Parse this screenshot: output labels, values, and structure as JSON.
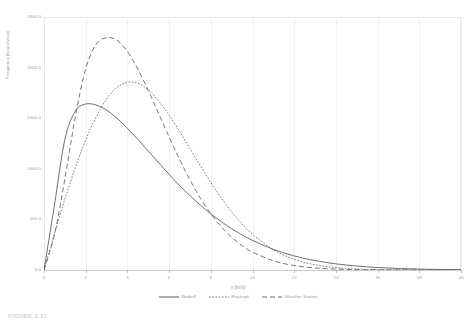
{
  "chart_data": {
    "type": "line",
    "title": "",
    "xlabel": "v [m/s]",
    "ylabel": "Frequency [hours/year]",
    "xlim": [
      0,
      20
    ],
    "ylim": [
      0,
      2500
    ],
    "grid": true,
    "legend_position": "bottom",
    "xticks": [
      "0",
      "2",
      "4",
      "6",
      "8",
      "10",
      "12",
      "14",
      "16",
      "18",
      "20"
    ],
    "xtick_values": [
      0,
      2,
      4,
      6,
      8,
      10,
      12,
      14,
      16,
      18,
      20
    ],
    "yticks": [
      "0.0",
      "500.0",
      "1000.0",
      "1500.0",
      "2000.0",
      "2500.0"
    ],
    "ytick_values": [
      0,
      500,
      1000,
      1500,
      2000,
      2500
    ],
    "x": [
      0,
      0.5,
      1,
      1.5,
      2,
      2.5,
      3,
      3.5,
      4,
      4.5,
      5,
      5.5,
      6,
      6.5,
      7,
      7.5,
      8,
      8.5,
      9,
      9.5,
      10,
      11,
      12,
      13,
      14,
      15,
      16,
      17,
      18,
      19,
      20
    ],
    "series": [
      {
        "name": "Weibull",
        "style": "solid",
        "color": "#4a4a4a",
        "peak_x": 1.6,
        "peak_y": 1640,
        "values": [
          0,
          640,
          1290,
          1570,
          1640,
          1630,
          1580,
          1500,
          1400,
          1290,
          1175,
          1060,
          945,
          835,
          735,
          640,
          555,
          478,
          408,
          347,
          293,
          204,
          139,
          93,
          61,
          39,
          25,
          15,
          9,
          5,
          3
        ]
      },
      {
        "name": "Rayleigh",
        "style": "dotted",
        "color": "#5a5a5a",
        "peak_x": 2.9,
        "peak_y": 1855,
        "values": [
          0,
          360,
          700,
          1010,
          1285,
          1510,
          1690,
          1805,
          1855,
          1845,
          1780,
          1670,
          1530,
          1370,
          1200,
          1030,
          865,
          712,
          575,
          456,
          354,
          201,
          106,
          52,
          24,
          10,
          4,
          2,
          1,
          0,
          0
        ]
      },
      {
        "name": "Weather Station",
        "style": "dashed",
        "color": "#555555",
        "peak_x": 2.6,
        "peak_y": 2300,
        "values": [
          0,
          345,
          900,
          1510,
          1990,
          2230,
          2295,
          2270,
          2160,
          1985,
          1775,
          1545,
          1315,
          1095,
          890,
          710,
          556,
          428,
          324,
          241,
          177,
          91,
          44,
          20,
          9,
          4,
          2,
          1,
          0,
          0,
          0
        ]
      }
    ]
  },
  "legend": {
    "items": [
      {
        "label": "Weibull"
      },
      {
        "label": "Rayleigh"
      },
      {
        "label": "Weather Station"
      }
    ]
  },
  "caption": {
    "text": "FIGURE 2.11"
  }
}
